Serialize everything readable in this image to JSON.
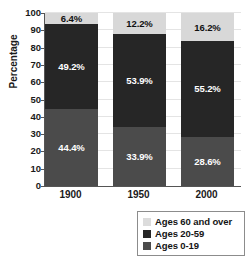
{
  "chart_data": {
    "type": "bar",
    "stacked": true,
    "stack_total": 100,
    "title": "",
    "subtitle": "",
    "xlabel": "",
    "ylabel": "Percentage",
    "categories": [
      "1900",
      "1950",
      "2000"
    ],
    "ylim": [
      0,
      100
    ],
    "y_ticks": [
      0,
      10,
      20,
      30,
      40,
      50,
      60,
      70,
      80,
      90,
      100
    ],
    "y_tick_labels": [
      "0",
      "10",
      "20",
      "30",
      "40",
      "50",
      "60",
      "70",
      "80",
      "90",
      "100"
    ],
    "grid": true,
    "legend_position": "bottom-right",
    "series": [
      {
        "name": "Ages 0-19",
        "color": "#4b4b4b",
        "label_color": "#ffffff",
        "values": [
          44.4,
          33.9,
          28.6
        ],
        "data_labels": [
          "44.4%",
          "33.9%",
          "28.6%"
        ]
      },
      {
        "name": "Ages 20-59",
        "color": "#262626",
        "label_color": "#ffffff",
        "values": [
          49.2,
          53.9,
          55.2
        ],
        "data_labels": [
          "49.2%",
          "53.9%",
          "55.2%"
        ]
      },
      {
        "name": "Ages 60 and over",
        "color": "#d8d8d8",
        "label_color": "#111111",
        "values": [
          6.4,
          12.2,
          16.2
        ],
        "data_labels": [
          "6.4%",
          "12.2%",
          "16.2%"
        ]
      }
    ],
    "legend_entries": [
      {
        "label": "Ages 60 and over",
        "color": "#dcdcdc"
      },
      {
        "label": "Ages 20-59",
        "color": "#262626"
      },
      {
        "label": "Ages 0-19",
        "color": "#4b4b4b"
      }
    ]
  },
  "axis": {
    "y_title": "Percentage"
  }
}
